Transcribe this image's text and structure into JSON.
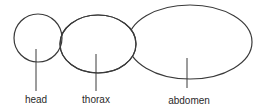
{
  "diagram": {
    "stroke_color": "#3a3a3a",
    "background": "#ffffff",
    "parts": [
      {
        "id": "head",
        "label": "head",
        "shape": "circle",
        "cx": 38,
        "cy": 38,
        "rx": 24,
        "ry": 24
      },
      {
        "id": "thorax",
        "label": "thorax",
        "shape": "ellipse",
        "cx": 98,
        "cy": 44,
        "rx": 38,
        "ry": 29
      },
      {
        "id": "abdomen",
        "label": "abdomen",
        "shape": "ellipse",
        "cx": 190,
        "cy": 42,
        "rx": 62,
        "ry": 37
      }
    ],
    "labels": {
      "head": "head",
      "thorax": "thorax",
      "abdomen": "abdomen"
    }
  }
}
